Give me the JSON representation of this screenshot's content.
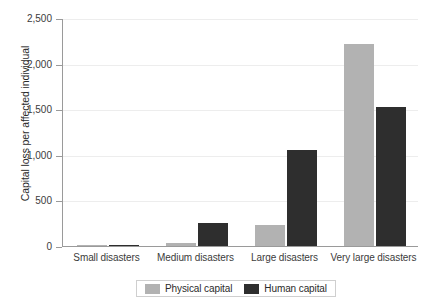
{
  "chart_data": {
    "type": "bar",
    "title": "",
    "subtitle": "",
    "xlabel": "",
    "ylabel": "Capital loss per affected individual",
    "categories": [
      "Small disasters",
      "Medium disasters",
      "Large disasters",
      "Very large disasters"
    ],
    "series": [
      {
        "name": "Physical capital",
        "color": "#b2b2b2",
        "values": [
          2,
          35,
          225,
          2220
        ]
      },
      {
        "name": "Human capital",
        "color": "#2e2e2e",
        "values": [
          3,
          250,
          1050,
          1520
        ]
      }
    ],
    "ylim": [
      0,
      2500
    ],
    "ytick_values": [
      0,
      500,
      1000,
      1500,
      2000,
      2500
    ],
    "ytick_labels": [
      "0",
      "500",
      "1,000",
      "1,500",
      "2,000",
      "2,500"
    ],
    "grid": true,
    "legend_position": "bottom"
  },
  "legend": {
    "items": [
      {
        "label": "Physical capital",
        "swatch": "physical-capital-swatch"
      },
      {
        "label": "Human capital",
        "swatch": "human-capital-swatch"
      }
    ]
  }
}
